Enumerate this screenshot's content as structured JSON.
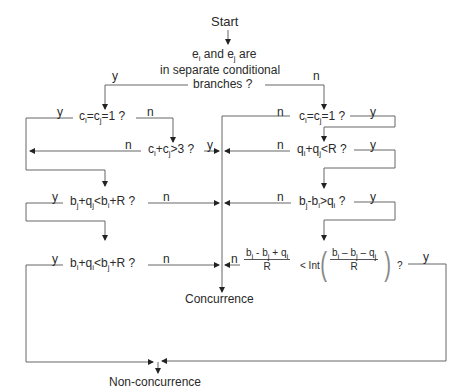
{
  "diagram": {
    "type": "flowchart",
    "start": "Start",
    "root_question": {
      "line1_prefix": "e",
      "line1_sub1": "i",
      "line1_mid": " and e",
      "line1_sub2": "j",
      "line1_suffix": " are",
      "line2": "in separate conditional",
      "line3": "branches ?"
    },
    "left_branch_label": "y",
    "right_branch_label": "n",
    "left": {
      "q1": {
        "a": "c",
        "s1": "i",
        "b": "=c",
        "s2": "j",
        "c": "=1 ?",
        "yes": "y",
        "no": "n"
      },
      "q2": {
        "a": "c",
        "s1": "i",
        "b": "+c",
        "s2": "j",
        "c": ">3 ?",
        "yes": "y",
        "no": "n"
      },
      "q3": {
        "a": "b",
        "s1": "j",
        "b": "+q",
        "s2": "j",
        "c": "<b",
        "s3": "i",
        "d": "+R ?",
        "yes": "y",
        "no": "n"
      },
      "q4": {
        "a": "b",
        "s1": "i",
        "b": "+q",
        "s2": "i",
        "c": "<b",
        "s3": "j",
        "d": "+R ?",
        "yes": "y",
        "no": "n"
      }
    },
    "right": {
      "q1": {
        "a": "c",
        "s1": "i",
        "b": "=c",
        "s2": "j",
        "c": "=1 ?",
        "yes": "y",
        "no": "n"
      },
      "q2": {
        "a": "q",
        "s1": "i",
        "b": "+q",
        "s2": "j",
        "c": "<R ?",
        "yes": "y",
        "no": "n"
      },
      "q3": {
        "a": "b",
        "s1": "j",
        "b": "-b",
        "s2": "i",
        "c": ">q",
        "s3": "i",
        "d": " ?",
        "yes": "y",
        "no": "n"
      },
      "q4": {
        "frac1_num": {
          "a": "b",
          "s1": "i",
          "b": " - b",
          "s2": "j",
          "c": " + q",
          "s3": "i"
        },
        "frac1_den": "R",
        "op": "< Int",
        "frac2_num": {
          "a": "b",
          "s1": "i",
          "b": " – b",
          "s2": "j",
          "c": " – q",
          "s3": "j"
        },
        "frac2_den": "R",
        "qmark": "?",
        "yes": "y",
        "no": "n"
      }
    },
    "outcome_concurrence": "Concurrence",
    "outcome_nonconcurrence": "Non-concurrence"
  }
}
